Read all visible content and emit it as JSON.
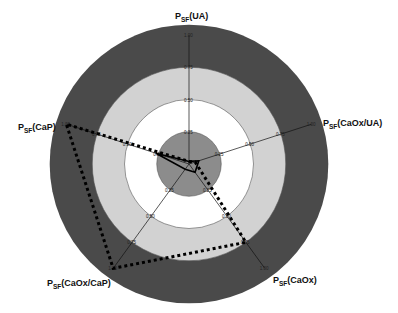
{
  "chart_data": {
    "type": "radar",
    "title": "",
    "axes": [
      {
        "name": "PSF(UA)",
        "base": "P",
        "sub": "SF",
        "suffix": "(UA)",
        "angle_deg": 90
      },
      {
        "name": "PSF(CaOx/UA)",
        "base": "P",
        "sub": "SF",
        "suffix": "(CaOx/UA)",
        "angle_deg": 18
      },
      {
        "name": "PSF(CaOx)",
        "base": "P",
        "sub": "SF",
        "suffix": "(CaOx)",
        "angle_deg": -54
      },
      {
        "name": "PSF(CaOx/CaP)",
        "base": "P",
        "sub": "SF",
        "suffix": "(CaOx/CaP)",
        "angle_deg": -126
      },
      {
        "name": "PSF(CaP)",
        "base": "P",
        "sub": "SF",
        "suffix": "(CaP)",
        "angle_deg": 162
      }
    ],
    "range": [
      0,
      1.0
    ],
    "ticks": [
      "0.25",
      "0.50",
      "0.75",
      "1.00"
    ],
    "tick_values": [
      0.25,
      0.5,
      0.75,
      1.0
    ],
    "bands": [
      {
        "from": 0.75,
        "to": 1.08,
        "color": "#4a4a4a"
      },
      {
        "from": 0.5,
        "to": 0.75,
        "color": "#d2d2d2"
      },
      {
        "from": 0.25,
        "to": 0.5,
        "color": "#ffffff"
      },
      {
        "from": 0.0,
        "to": 0.25,
        "color": "#8c8c8c"
      }
    ],
    "series": [
      {
        "name": "solid",
        "style": "solid",
        "color": "#000000",
        "values": [
          0.02,
          0.08,
          0.08,
          0.05,
          0.27
        ]
      },
      {
        "name": "dotted",
        "style": "dotted",
        "color": "#000000",
        "values": [
          0.02,
          0.05,
          0.75,
          1.0,
          1.0
        ]
      }
    ],
    "grid": true,
    "legend": "none"
  }
}
